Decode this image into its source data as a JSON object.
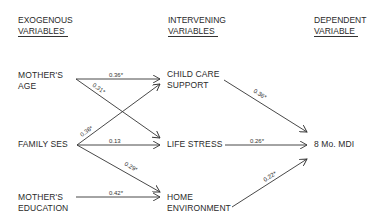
{
  "headers": {
    "exogenous": {
      "line1": "EXOGENOUS",
      "line2": "VARIABLES"
    },
    "intervening": {
      "line1": "INTERVENING",
      "line2": "VARIABLES"
    },
    "dependent": {
      "line1": "DEPENDENT",
      "line2": "VARIABLE"
    }
  },
  "nodes": {
    "mothers_age": {
      "line1": "MOTHER'S",
      "line2": "AGE"
    },
    "family_ses": {
      "line1": "FAMILY SES"
    },
    "mothers_education": {
      "line1": "MOTHER'S",
      "line2": "EDUCATION"
    },
    "child_care_support": {
      "line1": "CHILD CARE",
      "line2": "SUPPORT"
    },
    "life_stress": {
      "line1": "LIFE STRESS"
    },
    "home_environment": {
      "line1": "HOME",
      "line2": "ENVIRONMENT"
    },
    "mdi": {
      "line1": "8 Mo. MDI"
    }
  },
  "edges": [
    {
      "from": "MOTHER'S AGE",
      "to": "CHILD CARE SUPPORT",
      "coefficient": "0.36*"
    },
    {
      "from": "MOTHER'S AGE",
      "to": "LIFE STRESS",
      "coefficient": "0.31*"
    },
    {
      "from": "FAMILY SES",
      "to": "CHILD CARE SUPPORT",
      "coefficient": "0.36*"
    },
    {
      "from": "FAMILY SES",
      "to": "LIFE STRESS",
      "coefficient": "0.13"
    },
    {
      "from": "FAMILY SES",
      "to": "HOME ENVIRONMENT",
      "coefficient": "0.29*"
    },
    {
      "from": "MOTHER'S EDUCATION",
      "to": "HOME ENVIRONMENT",
      "coefficient": "0.42*"
    },
    {
      "from": "CHILD CARE SUPPORT",
      "to": "8 Mo. MDI",
      "coefficient": "0.36*"
    },
    {
      "from": "LIFE STRESS",
      "to": "8 Mo. MDI",
      "coefficient": "0.26*"
    },
    {
      "from": "HOME ENVIRONMENT",
      "to": "8 Mo. MDI",
      "coefficient": "0.22*"
    }
  ],
  "colors": {
    "line": "#333333",
    "text": "#2a2a2a",
    "background": "#ffffff"
  }
}
